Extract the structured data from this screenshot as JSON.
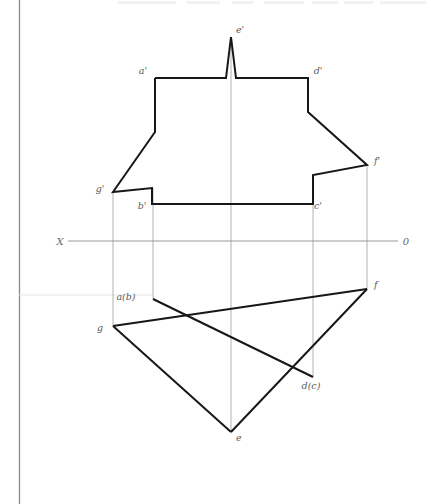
{
  "diagram": {
    "axis": {
      "left_label": "X",
      "right_label": "0",
      "y": 241,
      "x_start": 68,
      "x_end": 398
    },
    "front_view": {
      "name": "frontal projection (V-plane)",
      "labels": [
        {
          "id": "e-prime",
          "text": "e'",
          "x": 236,
          "y": 33,
          "px": 231,
          "py": 37
        },
        {
          "id": "a-prime",
          "text": "a'",
          "x": 143,
          "y": 74,
          "px": 155,
          "py": 78
        },
        {
          "id": "d-prime",
          "text": "d'",
          "x": 316,
          "y": 74,
          "px": 308,
          "py": 78
        },
        {
          "id": "f-prime",
          "text": "f'",
          "x": 373,
          "y": 163,
          "px": 367,
          "py": 165
        },
        {
          "id": "g-prime",
          "text": "g'",
          "x": 99,
          "y": 192,
          "px": 113,
          "py": 192
        },
        {
          "id": "b-prime",
          "text": "b'",
          "x": 140,
          "y": 208,
          "px": 152,
          "py": 204
        },
        {
          "id": "c-prime",
          "text": "c'",
          "x": 316,
          "y": 208,
          "px": 313,
          "py": 204
        }
      ],
      "outline": "155,78 155,132 113,192 152,188 152,204 313,204 313,175 367,165 308,112 308,78 236,78 231,37 226,78"
    },
    "top_view": {
      "name": "horizontal projection (H-plane)",
      "labels": [
        {
          "id": "a-b",
          "text": "a(b)",
          "x": 126,
          "y": 297,
          "px": 153,
          "py": 299
        },
        {
          "id": "f",
          "text": "f",
          "x": 373,
          "y": 287,
          "px": 367,
          "py": 289
        },
        {
          "id": "g",
          "text": "g",
          "x": 100,
          "y": 330,
          "px": 113,
          "py": 326
        },
        {
          "id": "d-c",
          "text": "d(c)",
          "x": 300,
          "y": 388,
          "px": 313,
          "py": 377
        },
        {
          "id": "e",
          "text": "e",
          "x": 234,
          "y": 441,
          "px": 231,
          "py": 432
        }
      ],
      "edges": [
        {
          "from": "a(b)",
          "to": "d(c)"
        },
        {
          "from": "g",
          "to": "f"
        },
        {
          "from": "g",
          "to": "e"
        },
        {
          "from": "e",
          "to": "f"
        }
      ]
    },
    "projectors": [
      {
        "id": "proj-g",
        "x": 113,
        "y1": 192,
        "y2": 326
      },
      {
        "id": "proj-b",
        "x": 153,
        "y1": 188,
        "y2": 299
      },
      {
        "id": "proj-e",
        "x": 231,
        "y1": 37,
        "y2": 432
      },
      {
        "id": "proj-c",
        "x": 313,
        "y1": 204,
        "y2": 377
      },
      {
        "id": "proj-f",
        "x": 367,
        "y1": 165,
        "y2": 289
      }
    ],
    "guides": [
      {
        "id": "guide-ab-horizontal",
        "x1": 19,
        "y1": 295,
        "x2": 153,
        "y2": 295
      }
    ],
    "colors": {
      "object_stroke": "#171717",
      "projector_stroke": "#a9a9a9",
      "axis_stroke": "#8e8e8e",
      "label_text": "#5a5a5a",
      "background": "#ffffff",
      "page_border": "#8a8a8a"
    }
  }
}
